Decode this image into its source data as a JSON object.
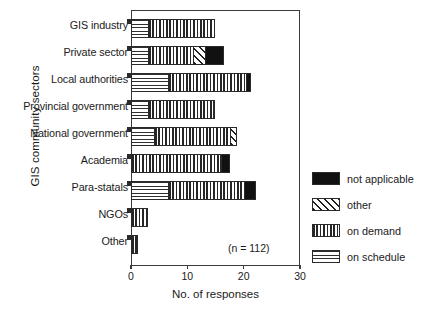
{
  "chart_data": {
    "type": "bar",
    "orientation": "horizontal",
    "stacked": true,
    "title": "",
    "xlabel": "No. of responses",
    "ylabel": "GIS community sectors",
    "xlim": [
      0,
      30
    ],
    "xticks": [
      0,
      10,
      20,
      30
    ],
    "xticklabels": [
      "0",
      "10",
      "20",
      "30"
    ],
    "grid": false,
    "legend_position": "right",
    "annotation": "(n = 112)",
    "categories": [
      "GIS industry",
      "Private sector",
      "Local authorities",
      "Provincial government",
      "National government",
      "Academia",
      "Para-statals",
      "NGOs",
      "Other"
    ],
    "series": [
      {
        "name": "on schedule",
        "pattern": "horizontal-lines",
        "color": "#ffffff",
        "values": [
          3,
          3,
          6.5,
          3,
          4,
          0,
          6.5,
          0,
          0
        ]
      },
      {
        "name": "on demand",
        "pattern": "vertical-lines",
        "color": "#ffffff",
        "values": [
          12,
          8,
          14,
          11.5,
          13.5,
          16,
          13.5,
          3,
          1.3
        ]
      },
      {
        "name": "other",
        "pattern": "diagonal-hatch",
        "color": "#ffffff",
        "values": [
          0,
          2.2,
          0,
          0,
          1.3,
          0,
          0,
          0,
          0
        ]
      },
      {
        "name": "not applicable",
        "pattern": "solid-black",
        "color": "#111111",
        "values": [
          0,
          3.3,
          0.8,
          0.5,
          0,
          1.5,
          2.2,
          0,
          0
        ]
      }
    ],
    "totals": [
      15,
      16.5,
      21.3,
      15,
      18.8,
      17.5,
      22.2,
      3,
      1.3
    ]
  },
  "legend": {
    "items": [
      {
        "label": "not applicable",
        "pattern": "solid-black"
      },
      {
        "label": "other",
        "pattern": "diagonal-hatch"
      },
      {
        "label": "on demand",
        "pattern": "vertical-lines"
      },
      {
        "label": "on schedule",
        "pattern": "horizontal-lines"
      }
    ]
  }
}
